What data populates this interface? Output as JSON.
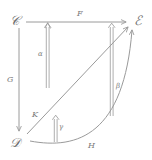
{
  "diagram": {
    "kind": "commutative-diagram",
    "background_color": "#ffffff",
    "line_color": "#9a9a9a",
    "text_color": "#6f6f6f",
    "objects": [
      {
        "id": "C",
        "label": "𝒞",
        "plain": "C",
        "position": "top-left"
      },
      {
        "id": "E",
        "label": "ℰ",
        "plain": "E",
        "position": "top-right"
      },
      {
        "id": "D",
        "label": "𝒟",
        "plain": "D",
        "position": "bottom-left"
      }
    ],
    "one_cells": [
      {
        "id": "F",
        "label": "F",
        "from": "C",
        "to": "E",
        "style": "straight",
        "direction": "right"
      },
      {
        "id": "G",
        "label": "G",
        "from": "C",
        "to": "D",
        "style": "straight",
        "direction": "down"
      },
      {
        "id": "K",
        "label": "K",
        "from": "D",
        "to": "E",
        "style": "diagonal",
        "direction": "up-right"
      },
      {
        "id": "H",
        "label": "H",
        "from": "D",
        "to": "E",
        "style": "curved",
        "direction": "right-up"
      }
    ],
    "two_cells": [
      {
        "id": "alpha",
        "label": "α",
        "style": "double-arrow",
        "direction": "up"
      },
      {
        "id": "beta",
        "label": "β",
        "style": "double-arrow",
        "direction": "up"
      },
      {
        "id": "gamma",
        "label": "γ",
        "style": "double-arrow",
        "direction": "up"
      }
    ]
  }
}
